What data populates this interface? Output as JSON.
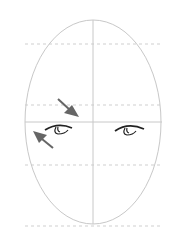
{
  "diagram": {
    "colors": {
      "guide": "#c8c8c8",
      "dashed": "#cfcfcf",
      "arrow": "#666666",
      "eye": "#222222"
    },
    "guides": {
      "dashed_y": [
        44,
        105,
        165,
        226
      ],
      "eye_line_y": 122,
      "center_x": 93
    },
    "arrows": [
      {
        "name": "arrow-down-right",
        "direction": "toward eye line"
      },
      {
        "name": "arrow-up-left",
        "direction": "toward face edge"
      }
    ],
    "eyes": [
      "left-eye",
      "right-eye"
    ]
  }
}
